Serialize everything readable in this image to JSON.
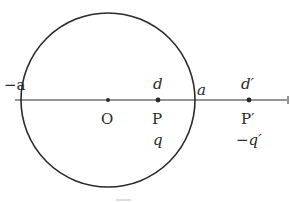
{
  "diagram": {
    "colors": {
      "stroke": "#2a2a2a",
      "background": "#ffffff"
    },
    "circle": {
      "cx": 108,
      "cy": 100,
      "r": 87
    },
    "axis": {
      "y": 100,
      "x1": 15,
      "x2": 289
    },
    "labels": {
      "neg_a": "−a",
      "center": "O",
      "d": "d",
      "P": "P",
      "q": "q",
      "a": "a",
      "d_prime": "d′",
      "P_prime": "P′",
      "neg_q_prime": "−q′"
    },
    "points": [
      {
        "name": "O",
        "x": 108
      },
      {
        "name": "P",
        "x": 158
      },
      {
        "name": "P′",
        "x": 249
      }
    ]
  }
}
